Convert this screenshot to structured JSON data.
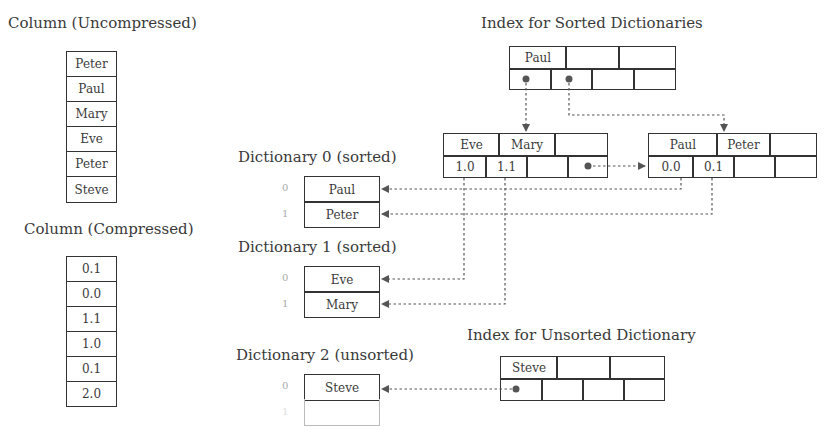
{
  "uncompressed": {
    "title": "Column (Uncompressed)",
    "values": [
      "Peter",
      "Paul",
      "Mary",
      "Eve",
      "Peter",
      "Steve"
    ]
  },
  "compressed": {
    "title": "Column (Compressed)",
    "values": [
      "0.1",
      "0.0",
      "1.1",
      "1.0",
      "0.1",
      "2.0"
    ]
  },
  "sorted_index": {
    "title": "Index for Sorted Dictionaries",
    "root": {
      "keys": [
        "Paul",
        "",
        ""
      ]
    },
    "leaf_left": {
      "keys": [
        "Eve",
        "Mary",
        ""
      ],
      "values": [
        "1.0",
        "1.1",
        "",
        ""
      ]
    },
    "leaf_right": {
      "keys": [
        "Paul",
        "Peter",
        ""
      ],
      "values": [
        "0.0",
        "0.1",
        "",
        ""
      ]
    }
  },
  "dictionaries": [
    {
      "title": "Dictionary 0 (sorted)",
      "indices": [
        "0",
        "1"
      ],
      "values": [
        "Paul",
        "Peter"
      ]
    },
    {
      "title": "Dictionary 1 (sorted)",
      "indices": [
        "0",
        "1"
      ],
      "values": [
        "Eve",
        "Mary"
      ]
    },
    {
      "title": "Dictionary 2 (unsorted)",
      "indices": [
        "0",
        "1"
      ],
      "values": [
        "Steve",
        ""
      ]
    }
  ],
  "unsorted_index": {
    "title": "Index for Unsorted Dictionary",
    "keys": [
      "Steve",
      "",
      ""
    ]
  },
  "colors": {
    "stroke": "#333333",
    "link": "#555555",
    "text": "#3a3a3a",
    "ghost": "#bbbbbb"
  }
}
